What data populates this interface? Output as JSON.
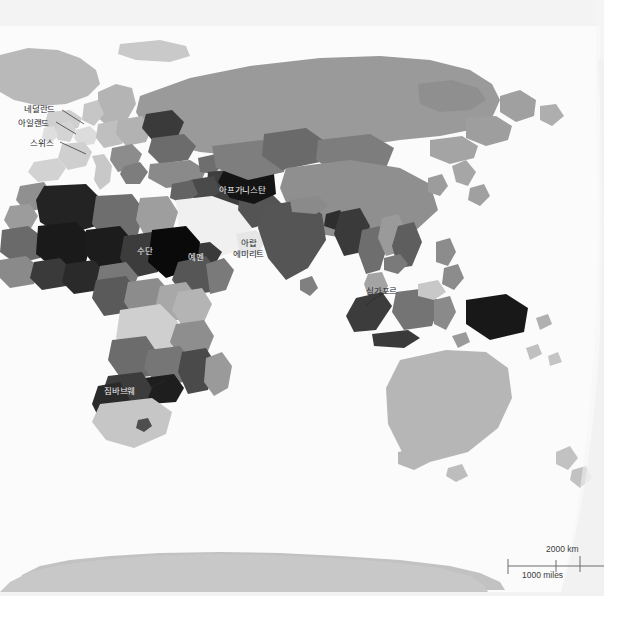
{
  "page": {
    "background_color": "#ffffff",
    "paper_tint_color": "#f3f3f3"
  },
  "map": {
    "type": "world-choropleth",
    "projection": "oval / elliptical (Eastern Hemisphere)",
    "ocean_color": "#ffffff",
    "antarctica_color": "#c4c4c4",
    "shading_scale": [
      "#0d0d0d",
      "#2e2e2e",
      "#4f4f4f",
      "#6e6e6e",
      "#8e8e8e",
      "#a9a9a9",
      "#c4c4c4",
      "#dcdcdc",
      "#efefef"
    ],
    "labels": [
      {
        "id": "netherlands",
        "text": "네덜란드",
        "style": "dark",
        "x": 24,
        "y": 104,
        "leader": true
      },
      {
        "id": "ireland",
        "text": "아일랜드",
        "style": "dark",
        "x": 18,
        "y": 118,
        "leader": true
      },
      {
        "id": "switzerland",
        "text": "스위스",
        "style": "dark",
        "x": 30,
        "y": 138,
        "leader": true
      },
      {
        "id": "afghanistan",
        "text": "아프가니스탄",
        "style": "light",
        "x": 219,
        "y": 185,
        "leader": false
      },
      {
        "id": "sudan",
        "text": "수단",
        "style": "light",
        "x": 137,
        "y": 246,
        "leader": false
      },
      {
        "id": "yemen",
        "text": "예멘",
        "style": "light",
        "x": 188,
        "y": 252,
        "leader": false
      },
      {
        "id": "uae-line1",
        "text": "아랍",
        "style": "dark",
        "x": 241,
        "y": 238,
        "leader": false
      },
      {
        "id": "uae-line2",
        "text": "에미리트",
        "style": "dark",
        "x": 233,
        "y": 249,
        "leader": false
      },
      {
        "id": "singapore",
        "text": "싱가포르",
        "style": "dark",
        "x": 366,
        "y": 286,
        "leader": true
      },
      {
        "id": "zimbabwe",
        "text": "짐바브웨",
        "style": "light",
        "x": 104,
        "y": 386,
        "leader": true
      }
    ]
  },
  "scale_bar": {
    "km_label": "2000 km",
    "miles_label": "1000 miles",
    "line_color": "#6a6c70"
  }
}
